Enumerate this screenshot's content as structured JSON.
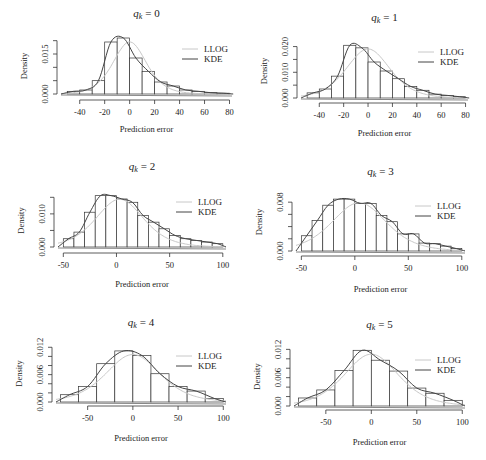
{
  "figure": {
    "legend": {
      "llog": "LLOG",
      "kde": "KDE"
    },
    "colors": {
      "llog": "#c8c8c8",
      "kde": "#444444",
      "bars": "#333333",
      "axis": "#333333"
    }
  },
  "chart_data": [
    {
      "type": "bar",
      "title": "q_k = 0",
      "title_var": "q",
      "title_sub": "k",
      "title_val": "= 0",
      "xlabel": "Prediction error",
      "ylabel": "Density",
      "bin_edges": [
        -50,
        -40,
        -30,
        -20,
        -10,
        0,
        10,
        20,
        30,
        40,
        50,
        60,
        70,
        80
      ],
      "values": [
        0.001,
        0.0015,
        0.005,
        0.0195,
        0.021,
        0.0135,
        0.0085,
        0.0045,
        0.003,
        0.0015,
        0.001,
        0.0005,
        0.0003
      ],
      "xticks": [
        -40,
        -20,
        0,
        20,
        40,
        60,
        80
      ],
      "yticks": [
        0.0,
        0.005,
        0.01,
        0.015,
        0.02
      ],
      "ytick_labels": [
        "0.000",
        "",
        "",
        "0.015",
        ""
      ],
      "xlim": [
        -55,
        82
      ],
      "ylim": [
        0,
        0.021
      ],
      "kde_peak_x": -4,
      "llog_mean": 0,
      "llog_scale": 9
    },
    {
      "type": "bar",
      "title": "q_k = 1",
      "title_var": "q",
      "title_sub": "k",
      "title_val": "= 1",
      "xlabel": "Prediction error",
      "ylabel": "Density",
      "bin_edges": [
        -50,
        -40,
        -30,
        -20,
        -10,
        0,
        10,
        20,
        30,
        40,
        50,
        60,
        70,
        80
      ],
      "values": [
        0.002,
        0.0035,
        0.0085,
        0.0205,
        0.0195,
        0.014,
        0.0105,
        0.0075,
        0.0045,
        0.003,
        0.0015,
        0.001,
        0.0005
      ],
      "xticks": [
        -40,
        -20,
        0,
        20,
        40,
        60,
        80
      ],
      "yticks": [
        0.0,
        0.005,
        0.01,
        0.015,
        0.02
      ],
      "ytick_labels": [
        "0.000",
        "",
        "0.010",
        "",
        "0.020"
      ],
      "xlim": [
        -55,
        82
      ],
      "ylim": [
        0,
        0.021
      ],
      "kde_peak_x": -9,
      "llog_mean": 0,
      "llog_scale": 12
    },
    {
      "type": "bar",
      "title": "q_k = 2",
      "title_var": "q",
      "title_sub": "k",
      "title_val": "= 2",
      "xlabel": "Prediction error",
      "ylabel": "Density",
      "bin_edges": [
        -50,
        -40,
        -30,
        -20,
        -10,
        0,
        10,
        20,
        30,
        40,
        50,
        60,
        70,
        80,
        90,
        100
      ],
      "values": [
        0.0025,
        0.0045,
        0.0105,
        0.0155,
        0.0155,
        0.0145,
        0.0135,
        0.0095,
        0.0075,
        0.0055,
        0.0035,
        0.0025,
        0.002,
        0.0015,
        0.001
      ],
      "xticks": [
        -50,
        0,
        50,
        100
      ],
      "yticks": [
        0.0,
        0.005,
        0.01,
        0.015
      ],
      "ytick_labels": [
        "0.000",
        "",
        "0.010",
        ""
      ],
      "xlim": [
        -55,
        103
      ],
      "ylim": [
        0,
        0.016
      ],
      "kde_peak_x": -9,
      "llog_mean": 3,
      "llog_scale": 15
    },
    {
      "type": "bar",
      "title": "q_k = 3",
      "title_var": "q",
      "title_sub": "k",
      "title_val": "= 3",
      "xlabel": "Prediction error",
      "ylabel": "Density",
      "bin_edges": [
        -50,
        -40,
        -30,
        -20,
        -10,
        0,
        10,
        20,
        30,
        40,
        50,
        60,
        70,
        80,
        90,
        100
      ],
      "values": [
        0.0025,
        0.005,
        0.0075,
        0.0085,
        0.0085,
        0.0078,
        0.0078,
        0.0058,
        0.0048,
        0.0028,
        0.0028,
        0.0013,
        0.0012,
        0.0008,
        0.0004
      ],
      "xticks": [
        -50,
        0,
        50,
        100
      ],
      "yticks": [
        0.0,
        0.002,
        0.004,
        0.006,
        0.008,
        0.01
      ],
      "ytick_labels": [
        "0.000",
        "",
        "",
        "",
        "0.008",
        ""
      ],
      "xlim": [
        -55,
        103
      ],
      "ylim": [
        0,
        0.0095
      ],
      "kde_peak_x": -8,
      "llog_mean": 4,
      "llog_scale": 17
    },
    {
      "type": "bar",
      "title": "q_k = 4",
      "title_var": "q",
      "title_sub": "k",
      "title_val": "= 4",
      "xlabel": "Prediction error",
      "ylabel": "Density",
      "bin_edges": [
        -80,
        -60,
        -40,
        -20,
        0,
        20,
        40,
        60,
        80,
        100
      ],
      "values": [
        0.0016,
        0.0034,
        0.0084,
        0.0112,
        0.0102,
        0.0062,
        0.0034,
        0.0024,
        0.0008
      ],
      "xticks": [
        -50,
        0,
        50,
        100
      ],
      "yticks": [
        0.0,
        0.002,
        0.004,
        0.006,
        0.008,
        0.01,
        0.012
      ],
      "ytick_labels": [
        "0.000",
        "",
        "",
        "0.006",
        "",
        "",
        "0.012"
      ],
      "xlim": [
        -85,
        103
      ],
      "ylim": [
        0,
        0.0125
      ],
      "kde_peak_x": -5,
      "llog_mean": 0,
      "llog_scale": 20
    },
    {
      "type": "bar",
      "title": "q_k = 5",
      "title_var": "q",
      "title_sub": "k",
      "title_val": "= 5",
      "xlabel": "Prediction error",
      "ylabel": "Density",
      "bin_edges": [
        -80,
        -60,
        -40,
        -20,
        0,
        20,
        40,
        60,
        80,
        100
      ],
      "values": [
        0.0017,
        0.0034,
        0.0075,
        0.0118,
        0.0097,
        0.0074,
        0.0038,
        0.0027,
        0.0012
      ],
      "xticks": [
        -50,
        0,
        50,
        100
      ],
      "yticks": [
        0.0,
        0.002,
        0.004,
        0.006,
        0.008,
        0.01,
        0.012
      ],
      "ytick_labels": [
        "0.000",
        "",
        "",
        "0.006",
        "",
        "",
        "0.012"
      ],
      "xlim": [
        -85,
        103
      ],
      "ylim": [
        0,
        0.0125
      ],
      "kde_peak_x": -4,
      "llog_mean": 0,
      "llog_scale": 20
    }
  ],
  "layout": [
    {
      "panel_x": 0,
      "panel_y": 0,
      "plot_left": 61,
      "plot_right": 232,
      "plot_top": 38,
      "plot_bottom": 94,
      "title_y": 17,
      "legend_y": 49,
      "xaxis_y": 100,
      "xlabel_y": 132
    },
    {
      "panel_x": 243,
      "panel_y": 0,
      "plot_left": 58,
      "plot_right": 225,
      "plot_top": 44,
      "plot_bottom": 98,
      "title_y": 21,
      "legend_y": 52,
      "xaxis_y": 103,
      "xlabel_y": 136
    },
    {
      "panel_x": 0,
      "panel_y": 140,
      "plot_left": 58,
      "plot_right": 226,
      "plot_top": 54,
      "plot_bottom": 107,
      "title_y": 30,
      "legend_y": 62,
      "xaxis_y": 113,
      "xlabel_y": 147
    },
    {
      "panel_x": 243,
      "panel_y": 140,
      "plot_left": 53,
      "plot_right": 222,
      "plot_top": 53,
      "plot_bottom": 111,
      "title_y": 35,
      "legend_y": 66,
      "xaxis_y": 116,
      "xlabel_y": 152
    },
    {
      "panel_x": 0,
      "panel_y": 300,
      "plot_left": 56,
      "plot_right": 226,
      "plot_top": 45,
      "plot_bottom": 102,
      "title_y": 26,
      "legend_y": 56,
      "xaxis_y": 106,
      "xlabel_y": 141
    },
    {
      "panel_x": 243,
      "panel_y": 300,
      "plot_left": 51,
      "plot_right": 222,
      "plot_top": 47,
      "plot_bottom": 106,
      "title_y": 28,
      "legend_y": 60,
      "xaxis_y": 110,
      "xlabel_y": 145
    }
  ]
}
